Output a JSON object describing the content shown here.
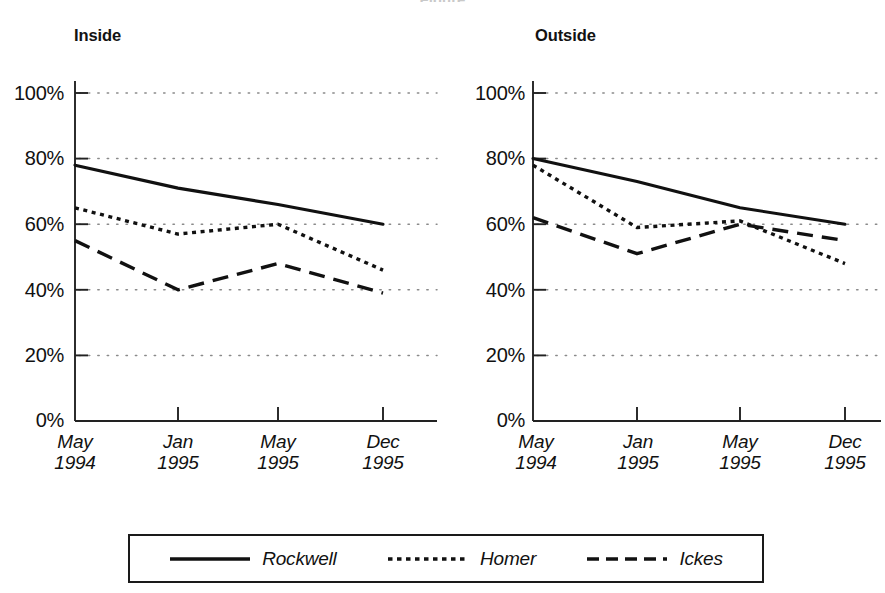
{
  "figure": {
    "clipped_title": "Figure",
    "panels": [
      {
        "title": "Inside"
      },
      {
        "title": "Outside"
      }
    ]
  },
  "axis": {
    "y_ticks": [
      "0%",
      "20%",
      "40%",
      "60%",
      "80%",
      "100%"
    ],
    "x_ticks": [
      {
        "month": "May",
        "year": "1994"
      },
      {
        "month": "Jan",
        "year": "1995"
      },
      {
        "month": "May",
        "year": "1995"
      },
      {
        "month": "Dec",
        "year": "1995"
      }
    ]
  },
  "legend": {
    "items": [
      {
        "label": "Rockwell",
        "style": "solid"
      },
      {
        "label": "Homer",
        "style": "dotted"
      },
      {
        "label": "Ickes",
        "style": "dashed"
      }
    ]
  },
  "chart_data": [
    {
      "type": "line",
      "title": "Inside",
      "xlabel": "",
      "ylabel": "",
      "categories": [
        "May 1994",
        "Jan 1995",
        "May 1995",
        "Dec 1995"
      ],
      "ylim": [
        0,
        100
      ],
      "ytick_values": [
        0,
        20,
        40,
        60,
        80,
        100
      ],
      "grid": "horizontal-dotted",
      "legend_position": "bottom",
      "series": [
        {
          "name": "Rockwell",
          "style": "solid",
          "values": [
            78,
            71,
            66,
            60
          ]
        },
        {
          "name": "Homer",
          "style": "dotted",
          "values": [
            65,
            57,
            60,
            46
          ]
        },
        {
          "name": "Ickes",
          "style": "dashed",
          "values": [
            55,
            40,
            48,
            39
          ]
        }
      ]
    },
    {
      "type": "line",
      "title": "Outside",
      "xlabel": "",
      "ylabel": "",
      "categories": [
        "May 1994",
        "Jan 1995",
        "May 1995",
        "Dec 1995"
      ],
      "ylim": [
        0,
        100
      ],
      "ytick_values": [
        0,
        20,
        40,
        60,
        80,
        100
      ],
      "grid": "horizontal-dotted",
      "legend_position": "bottom",
      "series": [
        {
          "name": "Rockwell",
          "style": "solid",
          "values": [
            80,
            73,
            65,
            60
          ]
        },
        {
          "name": "Homer",
          "style": "dotted",
          "values": [
            78,
            59,
            61,
            48
          ]
        },
        {
          "name": "Ickes",
          "style": "dashed",
          "values": [
            62,
            51,
            60,
            55
          ]
        }
      ]
    }
  ]
}
